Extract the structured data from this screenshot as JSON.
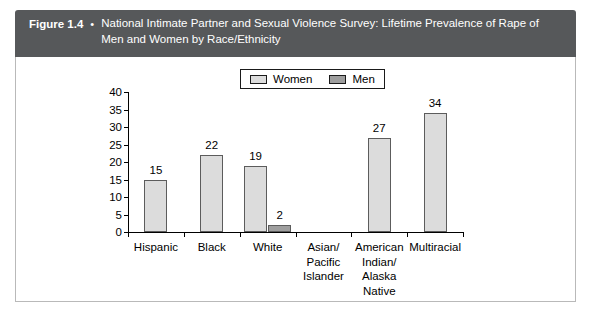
{
  "header": {
    "figure_number": "Figure 1.4",
    "bullet": "•",
    "title": "National Intimate Partner and Sexual Violence Survey: Lifetime Prevalence of Rape of Men and Women by Race/Ethnicity"
  },
  "colors": {
    "banner_bg": "#56585a",
    "banner_text": "#ffffff",
    "women_bar": "#dcdcdc",
    "men_bar": "#9e9e9e",
    "bar_outline": "#5c5c5c",
    "frame_border": "#b9b9b9",
    "axis": "#000000"
  },
  "legend": {
    "position": "top-center",
    "entries": [
      {
        "label": "Women",
        "color": "#dcdcdc",
        "icon": "legend-swatch-women"
      },
      {
        "label": "Men",
        "color": "#9e9e9e",
        "icon": "legend-swatch-men"
      }
    ]
  },
  "chart_data": {
    "type": "bar",
    "title": "National Intimate Partner and Sexual Violence Survey: Lifetime Prevalence of Rape of Men and Women by Race/Ethnicity",
    "xlabel": "",
    "ylabel": "",
    "grid": false,
    "legend_position": "top-center",
    "ylim": [
      0,
      40
    ],
    "yticks": [
      0,
      5,
      10,
      15,
      20,
      25,
      30,
      35,
      40
    ],
    "ytick_labels": [
      "0",
      "5",
      "10",
      "15",
      "20",
      "25",
      "30",
      "35",
      "40"
    ],
    "categories": [
      "Hispanic",
      "Black",
      "White",
      "Asian/ Pacific Islander",
      "American Indian/ Alaska Native",
      "Multiracial"
    ],
    "category_lines": [
      [
        "Hispanic"
      ],
      [
        "Black"
      ],
      [
        "White"
      ],
      [
        "Asian/",
        "Pacific",
        "Islander"
      ],
      [
        "American",
        "Indian/",
        "Alaska",
        "Native"
      ],
      [
        "Multiracial"
      ]
    ],
    "series": [
      {
        "name": "Women",
        "color": "#dcdcdc",
        "values": [
          15,
          22,
          19,
          null,
          27,
          34
        ],
        "value_labels": [
          "15",
          "22",
          "19",
          "",
          "27",
          "34"
        ]
      },
      {
        "name": "Men",
        "color": "#9e9e9e",
        "values": [
          null,
          null,
          2,
          null,
          null,
          null
        ],
        "value_labels": [
          "",
          "",
          "2",
          "",
          "",
          ""
        ]
      }
    ]
  }
}
